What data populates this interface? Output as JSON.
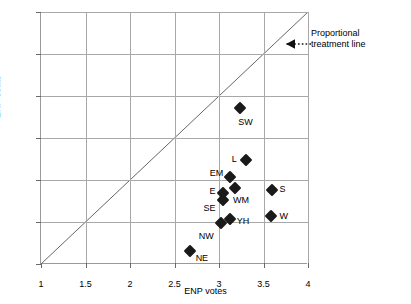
{
  "chart_data": {
    "type": "scatter",
    "title": "",
    "xlabel": "ENP votes",
    "ylabel": "ENP seats",
    "xlim": [
      1,
      4
    ],
    "ylim": [
      1,
      4
    ],
    "xticks": [
      "1",
      "1.5",
      "2",
      "2.5",
      "3",
      "3.5",
      "4"
    ],
    "xtick_values": [
      1,
      1.5,
      2,
      2.5,
      3,
      3.5,
      4
    ],
    "yticks": [
      "1.0",
      "1.5",
      "2.0",
      "2.5",
      "3.0",
      "3.5",
      "4.0"
    ],
    "ytick_values": [
      1.0,
      1.5,
      2.0,
      2.5,
      3.0,
      3.5,
      4.0
    ],
    "grid": true,
    "legend": "none",
    "marker": "filled-diamond",
    "marker_color": "#1a1a1a",
    "points": [
      {
        "label": "SW",
        "x": 3.24,
        "y": 2.86,
        "label_dx": -2,
        "label_dy": 14
      },
      {
        "label": "L",
        "x": 3.3,
        "y": 2.24,
        "label_dx": -14,
        "label_dy": -1
      },
      {
        "label": "EM",
        "x": 3.12,
        "y": 2.03,
        "label_dx": -20,
        "label_dy": -4
      },
      {
        "label": "E",
        "x": 3.05,
        "y": 1.84,
        "label_dx": -14,
        "label_dy": -2
      },
      {
        "label": "SE",
        "x": 3.05,
        "y": 1.76,
        "label_dx": -20,
        "label_dy": 8
      },
      {
        "label": "WM",
        "x": 3.18,
        "y": 1.91,
        "label_dx": -2,
        "label_dy": 12
      },
      {
        "label": "S",
        "x": 3.59,
        "y": 1.88,
        "label_dx": 8,
        "label_dy": -1
      },
      {
        "label": "YH",
        "x": 3.12,
        "y": 1.54,
        "label_dx": 7,
        "label_dy": 2
      },
      {
        "label": "W",
        "x": 3.58,
        "y": 1.57,
        "label_dx": 9,
        "label_dy": 0
      },
      {
        "label": "NW",
        "x": 3.02,
        "y": 1.49,
        "label_dx": -22,
        "label_dy": 13
      },
      {
        "label": "NE",
        "x": 2.67,
        "y": 1.15,
        "label_dx": 6,
        "label_dy": 7
      }
    ],
    "reference_line": {
      "name": "Proportional treatment line",
      "from": [
        1,
        1
      ],
      "to": [
        4,
        4
      ],
      "style": "solid-thin"
    },
    "annotation": {
      "line1": "Proportional",
      "line2": "treatment line",
      "arrow_style": "dotted-with-left-arrowhead"
    }
  }
}
